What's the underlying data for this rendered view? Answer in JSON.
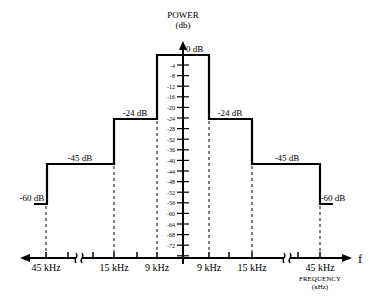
{
  "chart_data": {
    "type": "line",
    "title": "",
    "xlabel": "FREQUENCY (kHz)",
    "ylabel": "POWER (db)",
    "x_axis_symbol": "f",
    "x_tick_labels": [
      "45 kHz",
      "15 kHz",
      "9 kHz",
      "9 kHz",
      "15 kHz",
      "45 kHz"
    ],
    "y_tick_labels": [
      "-4",
      "-8",
      "-12",
      "-16",
      "-20",
      "-24",
      "-28",
      "-32",
      "-36",
      "-40",
      "-44",
      "-48",
      "-52",
      "-56",
      "-60",
      "-64",
      "-68",
      "-72"
    ],
    "ylim": [
      -76,
      0
    ],
    "grid": false,
    "axis_breaks": [
      "between 45 kHz and 15 kHz on both sides"
    ],
    "series": [
      {
        "name": "Spectral mask",
        "segments": [
          {
            "from": "-45 kHz edge",
            "to": "-45 kHz",
            "level_db": -60,
            "label": "-60 dB"
          },
          {
            "from": "-45 kHz",
            "to": "-15 kHz",
            "level_db": -45,
            "label": "-45 dB"
          },
          {
            "from": "-15 kHz",
            "to": "-9 kHz",
            "level_db": -24,
            "label": "-24 dB"
          },
          {
            "from": "-9 kHz",
            "to": "9 kHz",
            "level_db": 0,
            "label": "0 dB"
          },
          {
            "from": "9 kHz",
            "to": "15 kHz",
            "level_db": -24,
            "label": "-24 dB"
          },
          {
            "from": "15 kHz",
            "to": "45 kHz",
            "level_db": -45,
            "label": "-45 dB"
          },
          {
            "from": "45 kHz",
            "to": "45 kHz edge",
            "level_db": -60,
            "label": "-60 dB"
          }
        ]
      }
    ]
  },
  "labels": {
    "y_title_line1": "POWER",
    "y_title_line2": "(db)",
    "x_title_line1": "FREQUENCY",
    "x_title_line2": "(kHz)",
    "f": "f",
    "level_0": "0 dB",
    "level_24_left": "-24 dB",
    "level_24_right": "-24 dB",
    "level_45_left": "-45 dB",
    "level_45_right": "-45 dB",
    "level_60_left": "-60 dB",
    "level_60_right": "-60 dB",
    "xt0": "45 kHz",
    "xt1": "15 kHz",
    "xt2": "9 kHz",
    "xt3": "9 kHz",
    "xt4": "15 kHz",
    "xt5": "45 kHz",
    "yt": [
      "-4",
      "-8",
      "-12",
      "-16",
      "-20",
      "-24",
      "-28",
      "-32",
      "-36",
      "-40",
      "-44",
      "-48",
      "-52",
      "-56",
      "-60",
      "-64",
      "-68",
      "-72"
    ]
  }
}
